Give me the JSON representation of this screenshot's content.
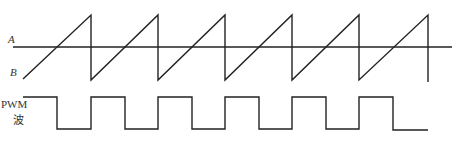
{
  "diagram": {
    "labels": {
      "a": "A",
      "b": "B",
      "pwm_line1": "PWM",
      "pwm_line2": "波"
    },
    "colors": {
      "stroke": "#222222",
      "background": "#ffffff"
    },
    "reference_line_A": {
      "y": 47,
      "x_start": 13,
      "x_end": 452
    },
    "sawtooth_B": {
      "start": [
        23,
        79
      ],
      "peak_y": 15,
      "trough_y": 80,
      "peak_x": [
        91,
        158,
        225,
        292,
        359,
        428
      ]
    },
    "pwm": {
      "high_y": 97,
      "low_y": 129,
      "start_x": 23,
      "edges_x": [
        57,
        91,
        125,
        158,
        192,
        225,
        259,
        292,
        326,
        359,
        393,
        428
      ]
    }
  }
}
